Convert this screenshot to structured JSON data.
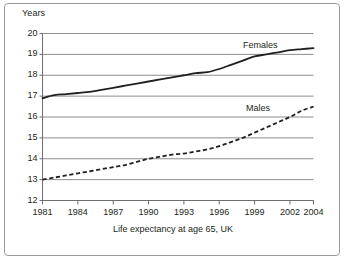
{
  "figure": {
    "unit_label": "Years",
    "caption": "Life expectancy at age 65, UK"
  },
  "series_labels": {
    "females": "Females",
    "males": "Males"
  },
  "chart_data": {
    "type": "line",
    "title": "Life expectancy at age 65, UK",
    "xlabel": "",
    "ylabel": "Years",
    "xlim": [
      1981,
      2004
    ],
    "ylim": [
      12,
      20
    ],
    "grid": true,
    "legend_position": "inline-annotation",
    "x_ticks": [
      1981,
      1984,
      1987,
      1990,
      1993,
      1996,
      1999,
      2002,
      2004
    ],
    "x_tick_labels": [
      "1981",
      "1984",
      "1987",
      "1990",
      "1993",
      "1996",
      "1999",
      "2002",
      "2004"
    ],
    "y_ticks": [
      12,
      13,
      14,
      15,
      16,
      17,
      18,
      19,
      20
    ],
    "y_tick_labels": [
      "12",
      "13",
      "14",
      "15",
      "16",
      "17",
      "18",
      "19",
      "20"
    ],
    "x": [
      1981,
      1982,
      1983,
      1984,
      1985,
      1986,
      1987,
      1988,
      1989,
      1990,
      1991,
      1992,
      1993,
      1994,
      1995,
      1996,
      1997,
      1998,
      1999,
      2000,
      2001,
      2002,
      2003,
      2004
    ],
    "series": [
      {
        "name": "Females",
        "style": "solid",
        "color": "#231f20",
        "values": [
          16.9,
          17.05,
          17.1,
          17.15,
          17.2,
          17.3,
          17.4,
          17.5,
          17.6,
          17.7,
          17.8,
          17.9,
          18.0,
          18.1,
          18.15,
          18.3,
          18.5,
          18.7,
          18.9,
          19.0,
          19.1,
          19.2,
          19.25,
          19.3
        ]
      },
      {
        "name": "Males",
        "style": "dashed",
        "color": "#231f20",
        "values": [
          13.0,
          13.1,
          13.2,
          13.3,
          13.4,
          13.5,
          13.6,
          13.7,
          13.85,
          14.0,
          14.1,
          14.2,
          14.25,
          14.35,
          14.45,
          14.6,
          14.8,
          15.0,
          15.25,
          15.5,
          15.75,
          16.0,
          16.3,
          16.5
        ]
      }
    ]
  }
}
